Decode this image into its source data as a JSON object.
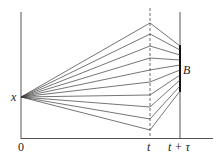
{
  "diagram": {
    "colors": {
      "line": "#3a3a3a",
      "text": "#222222",
      "background": "#ffffff"
    },
    "labels": {
      "origin": "0",
      "start_point": "x",
      "time_t": "t",
      "time_t_tau": "t + τ",
      "target_set": "B"
    },
    "start": {
      "x": 21,
      "y": 97
    },
    "t_line_x": 150,
    "ttau_line_x": 180,
    "B_segment": {
      "y1": 45,
      "y2": 92
    },
    "paths": [
      {
        "t_y": 23,
        "b_y": 46
      },
      {
        "t_y": 34,
        "b_y": 50
      },
      {
        "t_y": 46,
        "b_y": 55
      },
      {
        "t_y": 58,
        "b_y": 60
      },
      {
        "t_y": 70,
        "b_y": 65
      },
      {
        "t_y": 82,
        "b_y": 70
      },
      {
        "t_y": 95,
        "b_y": 75
      },
      {
        "t_y": 107,
        "b_y": 80
      },
      {
        "t_y": 119,
        "b_y": 86
      },
      {
        "t_y": 130,
        "b_y": 91
      }
    ]
  }
}
